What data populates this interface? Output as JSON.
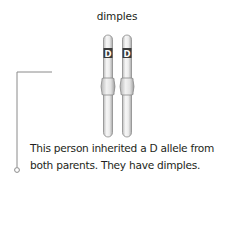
{
  "title": "dimples",
  "chromosomes": [
    {
      "id": "left",
      "allele_label": "D"
    },
    {
      "id": "right",
      "allele_label": "D"
    }
  ],
  "caption": {
    "line1": "This person inherited a D allele from",
    "line2": "both parents. They have dimples."
  },
  "colors": {
    "chromosome_fill": "#e6e6e6",
    "chromosome_stroke": "#8c8c8c",
    "band_fill": "#3a3a3a",
    "leader_line": "#8a8a8a",
    "text": "#231f20"
  }
}
